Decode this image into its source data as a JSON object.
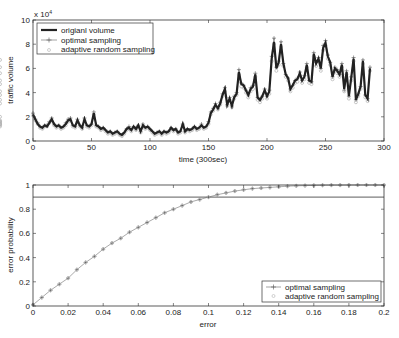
{
  "chart_data": [
    {
      "type": "line",
      "title": "",
      "xlabel": "time (300sec)",
      "ylabel": "traffic volume",
      "y_exponent_label": "x 10^4",
      "xlim": [
        0,
        300
      ],
      "ylim": [
        0,
        10
      ],
      "xticks": [
        0,
        50,
        100,
        150,
        200,
        250,
        300
      ],
      "yticks": [
        0,
        2,
        4,
        6,
        8,
        10
      ],
      "grid": false,
      "legend": {
        "placement": "top-left",
        "entries": [
          "origianl volume",
          "optimal sampling",
          "adaptive random sampling"
        ]
      },
      "x": [
        0,
        2,
        4,
        6,
        8,
        10,
        12,
        14,
        16,
        18,
        20,
        22,
        24,
        26,
        28,
        30,
        32,
        34,
        36,
        38,
        40,
        42,
        44,
        46,
        48,
        50,
        52,
        54,
        56,
        58,
        60,
        62,
        64,
        66,
        68,
        70,
        72,
        74,
        76,
        78,
        80,
        82,
        84,
        86,
        88,
        90,
        92,
        94,
        96,
        98,
        100,
        102,
        104,
        106,
        108,
        110,
        112,
        114,
        116,
        118,
        120,
        122,
        124,
        126,
        128,
        130,
        132,
        134,
        136,
        138,
        140,
        142,
        144,
        146,
        148,
        150,
        152,
        154,
        156,
        158,
        160,
        162,
        164,
        166,
        168,
        170,
        172,
        174,
        176,
        178,
        180,
        182,
        184,
        186,
        188,
        190,
        192,
        194,
        196,
        198,
        200,
        202,
        204,
        206,
        208,
        210,
        212,
        214,
        216,
        218,
        220,
        222,
        224,
        226,
        228,
        230,
        232,
        234,
        236,
        238,
        240,
        242,
        244,
        246,
        248,
        250,
        252,
        254,
        256,
        258,
        260,
        262,
        264,
        266,
        268,
        270,
        272,
        274,
        276,
        278,
        280,
        282,
        284,
        286,
        288
      ],
      "series": [
        {
          "name": "origianl volume",
          "values": [
            2.2,
            1.8,
            1.4,
            1.2,
            1.1,
            1.3,
            1.2,
            1.5,
            1.8,
            1.4,
            1.2,
            1.3,
            1.1,
            1.2,
            1.4,
            1.7,
            1.8,
            1.3,
            1.2,
            1.7,
            1.3,
            1.1,
            1.8,
            1.3,
            1.2,
            1.4,
            2.3,
            1.3,
            1.2,
            1.0,
            1.1,
            0.9,
            0.7,
            0.8,
            0.6,
            0.7,
            0.8,
            0.6,
            0.5,
            0.7,
            1.0,
            1.1,
            0.9,
            1.2,
            1.0,
            1.3,
            0.8,
            1.3,
            1.1,
            1.2,
            1.0,
            0.8,
            0.6,
            0.7,
            0.8,
            0.6,
            0.8,
            0.7,
            0.8,
            1.1,
            0.9,
            1.0,
            0.7,
            0.8,
            1.4,
            0.8,
            1.0,
            0.9,
            1.0,
            1.2,
            1.0,
            1.1,
            1.3,
            1.1,
            1.2,
            1.5,
            2.3,
            2.6,
            3.0,
            2.7,
            3.1,
            3.8,
            4.3,
            3.0,
            3.5,
            2.9,
            3.6,
            3.9,
            5.7,
            4.7,
            4.6,
            4.2,
            3.8,
            4.3,
            4.5,
            5.5,
            3.6,
            3.4,
            3.7,
            4.2,
            3.7,
            4.1,
            6.8,
            8.2,
            6.0,
            6.5,
            8.0,
            6.4,
            5.5,
            5.2,
            4.3,
            4.6,
            5.0,
            5.1,
            5.6,
            5.0,
            5.3,
            6.3,
            5.0,
            4.9,
            7.2,
            6.4,
            6.8,
            6.0,
            7.7,
            8.1,
            7.0,
            6.5,
            5.3,
            6.0,
            5.8,
            5.5,
            6.3,
            4.3,
            5.7,
            3.7,
            5.2,
            6.8,
            3.4,
            3.9,
            4.5,
            6.6,
            3.8,
            3.5,
            6.0,
            3.3,
            4.0,
            6.3,
            6.9,
            5.8,
            5.2,
            4.9,
            4.3,
            3.6,
            1.8,
            1.6,
            1.7,
            1.5,
            1.7,
            1.4,
            1.3,
            1.5,
            2.1
          ]
        },
        {
          "name": "optimal sampling",
          "values": [
            2.3,
            1.8,
            1.5,
            1.2,
            1.1,
            1.3,
            1.3,
            1.6,
            1.9,
            1.4,
            1.2,
            1.3,
            1.1,
            1.2,
            1.5,
            1.8,
            1.9,
            1.3,
            1.2,
            1.8,
            1.3,
            1.1,
            1.9,
            1.3,
            1.2,
            1.4,
            2.4,
            1.3,
            1.2,
            1.0,
            1.1,
            0.9,
            0.7,
            0.8,
            0.6,
            0.7,
            0.8,
            0.6,
            0.5,
            0.7,
            1.0,
            1.2,
            0.9,
            1.2,
            1.0,
            1.3,
            0.8,
            1.4,
            1.1,
            1.2,
            1.0,
            0.8,
            0.6,
            0.7,
            0.8,
            0.6,
            0.8,
            0.7,
            0.8,
            1.1,
            0.9,
            1.0,
            0.7,
            0.8,
            1.4,
            0.8,
            1.0,
            0.9,
            1.0,
            1.2,
            1.0,
            1.1,
            1.4,
            1.1,
            1.2,
            1.6,
            2.4,
            2.7,
            3.1,
            2.7,
            3.2,
            3.9,
            4.4,
            3.0,
            3.6,
            2.9,
            3.7,
            4.0,
            5.9,
            4.8,
            4.6,
            4.2,
            3.8,
            4.4,
            4.6,
            5.6,
            3.6,
            3.4,
            3.7,
            4.3,
            3.7,
            4.2,
            7.0,
            8.5,
            6.1,
            6.6,
            8.2,
            6.4,
            5.5,
            5.2,
            4.3,
            4.6,
            5.0,
            5.2,
            5.7,
            5.0,
            5.4,
            6.4,
            5.0,
            4.9,
            7.3,
            6.5,
            6.9,
            6.0,
            7.9,
            8.3,
            7.1,
            6.5,
            5.3,
            6.1,
            5.9,
            5.5,
            6.4,
            4.2,
            5.8,
            3.7,
            5.3,
            6.9,
            3.4,
            3.9,
            4.5,
            6.7,
            3.8,
            3.5,
            6.1,
            3.3,
            4.0,
            6.4,
            7.1,
            5.8,
            5.2,
            4.9,
            4.3,
            3.6,
            1.8,
            1.6,
            1.7,
            1.5,
            1.7,
            1.4,
            1.3,
            1.5,
            2.2
          ]
        },
        {
          "name": "adaptive random sampling",
          "values": [
            2.1,
            1.7,
            1.4,
            1.1,
            1.0,
            1.2,
            1.2,
            1.5,
            1.7,
            1.3,
            1.1,
            1.2,
            1.0,
            1.1,
            1.3,
            1.6,
            1.7,
            1.2,
            1.1,
            1.6,
            1.2,
            1.0,
            1.7,
            1.2,
            1.1,
            1.3,
            2.2,
            1.2,
            1.1,
            0.9,
            1.0,
            0.8,
            0.6,
            0.7,
            0.5,
            0.6,
            0.7,
            0.5,
            0.4,
            0.6,
            0.9,
            1.0,
            0.8,
            1.1,
            0.9,
            1.2,
            0.7,
            1.2,
            1.0,
            1.1,
            0.9,
            0.7,
            0.5,
            0.6,
            0.7,
            0.5,
            0.7,
            0.6,
            0.7,
            1.0,
            0.8,
            0.9,
            0.6,
            0.7,
            1.3,
            0.7,
            0.9,
            0.8,
            0.9,
            1.1,
            0.9,
            1.0,
            1.2,
            1.0,
            1.1,
            1.4,
            2.2,
            2.5,
            2.9,
            2.6,
            3.0,
            3.7,
            4.1,
            2.9,
            3.4,
            2.8,
            3.5,
            3.8,
            5.5,
            4.5,
            4.4,
            4.0,
            3.6,
            4.1,
            4.3,
            5.3,
            3.4,
            3.2,
            3.5,
            4.0,
            3.5,
            3.9,
            6.6,
            8.0,
            5.8,
            6.3,
            7.8,
            6.2,
            5.3,
            5.0,
            4.1,
            4.4,
            4.8,
            4.9,
            5.4,
            4.8,
            5.1,
            6.1,
            4.8,
            4.7,
            7.0,
            6.2,
            6.6,
            5.8,
            7.5,
            7.9,
            6.8,
            6.3,
            5.1,
            5.8,
            5.6,
            5.3,
            6.1,
            4.1,
            5.5,
            3.5,
            5.0,
            6.6,
            3.2,
            3.7,
            4.3,
            6.4,
            3.6,
            3.3,
            5.8,
            3.1,
            3.8,
            6.1,
            6.7,
            5.6,
            5.0,
            4.7,
            4.1,
            3.4,
            1.7,
            1.5,
            1.6,
            1.4,
            1.6,
            1.3,
            1.2,
            1.4,
            2.0
          ]
        }
      ]
    },
    {
      "type": "line",
      "title": "",
      "xlabel": "error",
      "ylabel": "error probability",
      "xlim": [
        0,
        0.2
      ],
      "ylim": [
        0,
        1
      ],
      "xticks": [
        0,
        0.02,
        0.04,
        0.06,
        0.08,
        0.1,
        0.12,
        0.14,
        0.16,
        0.18,
        0.2
      ],
      "yticks": [
        0,
        0.2,
        0.4,
        0.6,
        0.8,
        1
      ],
      "grid": false,
      "reference_line": {
        "y": 0.9
      },
      "legend": {
        "placement": "bottom-right",
        "entries": [
          "optimal sampling",
          "adaptive random sampling"
        ]
      },
      "x": [
        0,
        0.005,
        0.01,
        0.015,
        0.02,
        0.025,
        0.03,
        0.035,
        0.04,
        0.045,
        0.05,
        0.055,
        0.06,
        0.065,
        0.07,
        0.075,
        0.08,
        0.085,
        0.09,
        0.095,
        0.1,
        0.105,
        0.11,
        0.115,
        0.12,
        0.125,
        0.13,
        0.135,
        0.14,
        0.145,
        0.15,
        0.155,
        0.16,
        0.165,
        0.17,
        0.175,
        0.18,
        0.185,
        0.19,
        0.195,
        0.2
      ],
      "series": [
        {
          "name": "optimal sampling",
          "values": [
            0.01,
            0.07,
            0.13,
            0.18,
            0.23,
            0.3,
            0.36,
            0.41,
            0.47,
            0.52,
            0.56,
            0.61,
            0.65,
            0.69,
            0.73,
            0.77,
            0.8,
            0.83,
            0.86,
            0.88,
            0.9,
            0.92,
            0.935,
            0.95,
            0.96,
            0.97,
            0.975,
            0.98,
            0.985,
            0.99,
            0.993,
            0.995,
            0.997,
            0.998,
            0.999,
            0.999,
            1.0,
            1.0,
            1.0,
            1.0,
            1.0
          ]
        },
        {
          "name": "adaptive random sampling",
          "values": [
            0.01,
            0.07,
            0.13,
            0.18,
            0.23,
            0.3,
            0.36,
            0.41,
            0.47,
            0.52,
            0.56,
            0.61,
            0.65,
            0.69,
            0.73,
            0.77,
            0.8,
            0.83,
            0.86,
            0.88,
            0.9,
            0.92,
            0.935,
            0.95,
            0.96,
            0.97,
            0.975,
            0.98,
            0.985,
            0.99,
            0.993,
            0.995,
            0.997,
            0.998,
            0.999,
            0.999,
            1.0,
            1.0,
            1.0,
            1.0,
            1.0
          ]
        }
      ]
    }
  ],
  "top": {
    "exponent_label": "x 10",
    "exponent_power": "4",
    "xlabel": "time (300sec)",
    "ylabel": "traffic volume",
    "xtick_labels": [
      "0",
      "50",
      "100",
      "150",
      "200",
      "250",
      "300"
    ],
    "ytick_labels": [
      "0",
      "2",
      "4",
      "6",
      "8",
      "10"
    ],
    "legend": [
      "origianl volume",
      "optimal sampling",
      "adaptive random sampling"
    ]
  },
  "bottom": {
    "xlabel": "error",
    "ylabel": "error probability",
    "xtick_labels": [
      "0",
      "0.02",
      "0.04",
      "0.06",
      "0.08",
      "0.1",
      "0.12",
      "0.14",
      "0.16",
      "0.18",
      "0.2"
    ],
    "ytick_labels": [
      "0",
      "0.2",
      "0.4",
      "0.6",
      "0.8",
      "1"
    ],
    "legend": [
      "optimal sampling",
      "adaptive random sampling"
    ]
  },
  "colors": {
    "axis": "#333333",
    "original": "#222222",
    "optimal": "#555555",
    "adaptive": "#b0b0b0"
  }
}
